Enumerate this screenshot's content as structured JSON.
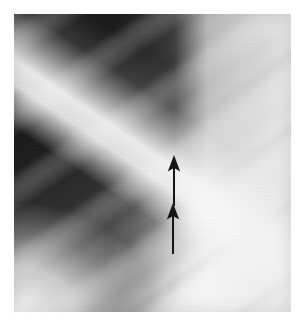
{
  "figure": {
    "kind": "radiograph",
    "modality_label": "chest-radiograph",
    "view_label": "coned-down lateral chest wall",
    "caption": "",
    "plate": {
      "left": 14,
      "top": 14,
      "width": 277,
      "height": 298,
      "background_color": "#f2f2f2"
    },
    "regions": [
      {
        "name": "dark-lung-field",
        "description": "dark radiolucent upper-left field",
        "color": "#262626"
      },
      {
        "name": "rib-shadows",
        "description": "oblique rib bands running upper-right to lower-left",
        "color": "#8a8a8a"
      },
      {
        "name": "bright-diaphragm-band",
        "description": "bright band sweeping from lower-left toward upper-right",
        "color": "#fbfbfb"
      },
      {
        "name": "soft-tissue-field",
        "description": "bright soft-tissue / extrapleural field on the right",
        "color": "#f1f1f1"
      }
    ],
    "annotations": [
      {
        "name": "upper-arrow",
        "glyph": "arrow-up-icon",
        "color": "#151515",
        "x": 174,
        "y_tip": 155,
        "y_tail": 192,
        "length": 37
      },
      {
        "name": "lower-arrow",
        "glyph": "arrow-up-icon",
        "color": "#151515",
        "x": 173,
        "y_tip": 203,
        "y_tail": 240,
        "length": 37
      }
    ]
  }
}
